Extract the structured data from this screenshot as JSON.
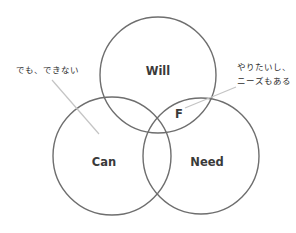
{
  "diagram": {
    "type": "venn",
    "sets": [
      {
        "id": "will",
        "label": "Will"
      },
      {
        "id": "can",
        "label": "Can"
      },
      {
        "id": "need",
        "label": "Need"
      }
    ],
    "intersection_label": "F",
    "annotations": [
      {
        "id": "cannot",
        "lines": [
          "でも、できない"
        ],
        "points_to": "Will ∩ Need (outside Can)"
      },
      {
        "id": "want-need",
        "lines": [
          "やりたいし、",
          "ニーズもある"
        ],
        "points_to": "Will ∩ Need"
      }
    ],
    "colors": {
      "circle_stroke": "#6e6e6e",
      "leader_line": "#c4c4c4",
      "text": "#3a3a3a",
      "background": "#ffffff"
    }
  }
}
